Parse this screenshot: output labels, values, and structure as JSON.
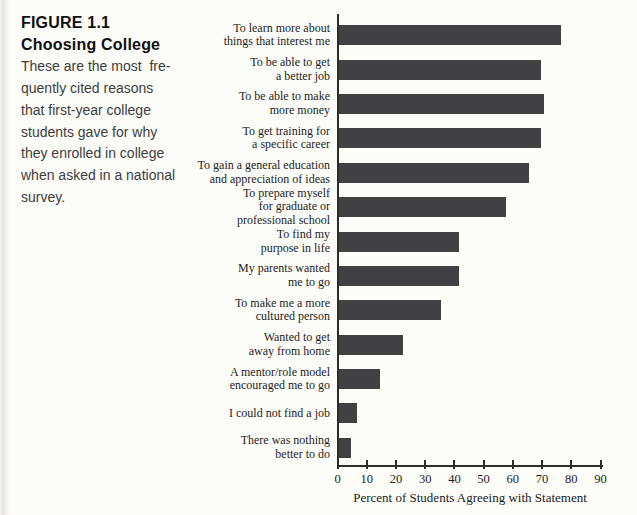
{
  "figure": {
    "label": "FIGURE 1.1",
    "title": "Choosing College",
    "caption_lines": [
      "These are the most  fre-",
      "quently cited reasons",
      "that first-year college",
      "students gave for why",
      "they enrolled in college",
      "when asked in a national",
      "survey."
    ]
  },
  "chart_data": {
    "type": "bar",
    "orientation": "horizontal",
    "title": "",
    "xlabel": "Percent of Students Agreeing with Statement",
    "xlim": [
      0,
      90
    ],
    "xticks": [
      0,
      10,
      20,
      30,
      40,
      50,
      60,
      70,
      80,
      90
    ],
    "grid": false,
    "legend": false,
    "bar_color": "#414143",
    "categories": [
      [
        "To learn more about",
        "things that interest me"
      ],
      [
        "To be able to get",
        "a better job"
      ],
      [
        "To be able to make",
        "more money"
      ],
      [
        "To get training for",
        "a specific career"
      ],
      [
        "To gain a general education",
        "and appreciation of ideas"
      ],
      [
        "To prepare myself",
        "for graduate or",
        "professional school"
      ],
      [
        "To find my",
        "purpose in life"
      ],
      [
        "My parents wanted",
        "me to go"
      ],
      [
        "To make me a more",
        "cultured person"
      ],
      [
        "Wanted to get",
        "away from home"
      ],
      [
        "A mentor/role model",
        "encouraged me to go"
      ],
      [
        "I could not find a job"
      ],
      [
        "There was nothing",
        "better to do"
      ]
    ],
    "values": [
      76,
      69,
      70,
      69,
      65,
      57,
      41,
      41,
      35,
      22,
      14,
      6,
      4
    ]
  }
}
